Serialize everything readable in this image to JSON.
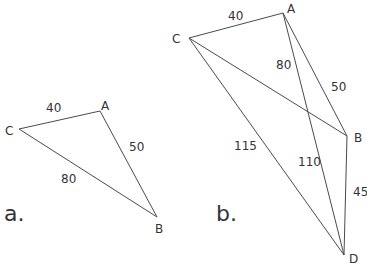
{
  "panels": [
    {
      "id": "a",
      "label": "a.",
      "vertices": {
        "A": "A",
        "B": "B",
        "C": "C"
      },
      "edges": [
        {
          "from": "C",
          "to": "A",
          "length": "40"
        },
        {
          "from": "A",
          "to": "B",
          "length": "50"
        },
        {
          "from": "C",
          "to": "B",
          "length": "80"
        }
      ]
    },
    {
      "id": "b",
      "label": "b.",
      "vertices": {
        "A": "A",
        "B": "B",
        "C": "C",
        "D": "D"
      },
      "edges": [
        {
          "from": "C",
          "to": "A",
          "length": "40"
        },
        {
          "from": "A",
          "to": "B",
          "length": "50"
        },
        {
          "from": "C",
          "to": "B",
          "length": "80"
        },
        {
          "from": "C",
          "to": "D",
          "length": "115"
        },
        {
          "from": "A",
          "to": "D",
          "length": "110"
        },
        {
          "from": "B",
          "to": "D",
          "length": "45"
        }
      ]
    }
  ]
}
